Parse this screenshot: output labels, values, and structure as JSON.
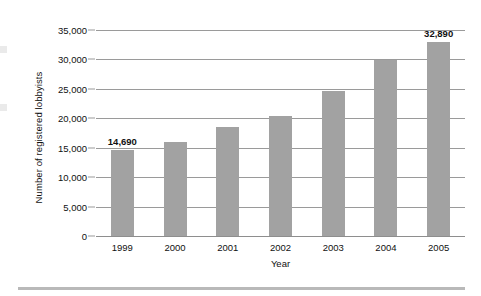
{
  "chart_data": {
    "type": "bar",
    "title": "",
    "subtitle": "",
    "xlabel": "Year",
    "ylabel": "Number of registered lobbyists",
    "categories": [
      "1999",
      "2000",
      "2001",
      "2002",
      "2003",
      "2004",
      "2005"
    ],
    "values": [
      14690,
      16000,
      18600,
      20400,
      24600,
      29900,
      32890
    ],
    "point_labels": [
      "14,690",
      "",
      "",
      "",
      "",
      "",
      "32,890"
    ],
    "ylim": [
      0,
      35000
    ],
    "ytick_labels": [
      "0",
      "5,000",
      "10,000",
      "15,000",
      "20,000",
      "25,000",
      "30,000",
      "35,000"
    ],
    "ytick_values": [
      0,
      5000,
      10000,
      15000,
      20000,
      25000,
      30000,
      35000
    ],
    "grid": "horizontal",
    "legend": "none",
    "bar_color": "#a2a2a2",
    "gridline_color": "#9a9a9a",
    "text_color": "#111111",
    "background_color": "#ffffff"
  }
}
